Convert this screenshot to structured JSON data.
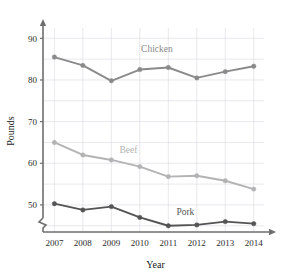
{
  "chart_data": {
    "type": "line",
    "title": "",
    "xlabel": "Year",
    "ylabel": "Pounds",
    "categories": [
      "2007",
      "2008",
      "2009",
      "2010",
      "2011",
      "2012",
      "2013",
      "2014"
    ],
    "x": [
      2007,
      2008,
      2009,
      2010,
      2011,
      2012,
      2013,
      2014
    ],
    "xlim": [
      2006.6,
      2014.5
    ],
    "ylim": [
      43.5,
      92
    ],
    "y_ticks": [
      50,
      60,
      70,
      80,
      90
    ],
    "y_tick_labels": [
      "50",
      "60",
      "70",
      "80",
      "90"
    ],
    "y_minor_gridlines": [
      45,
      50,
      55,
      60,
      65,
      70,
      75,
      80,
      85,
      90
    ],
    "grid": true,
    "axis_break": true,
    "legend": "inline-labels",
    "series": [
      {
        "name": "Chicken",
        "color": "#8a8a8a",
        "values": [
          85.5,
          83.5,
          79.8,
          82.5,
          83.0,
          80.5,
          82.0,
          83.3
        ],
        "label_x": 2010.6,
        "label_y": 86.6
      },
      {
        "name": "Beef",
        "color": "#b3b3b3",
        "values": [
          65.0,
          62.0,
          60.8,
          59.2,
          56.8,
          57.0,
          55.8,
          53.8
        ],
        "label_x": 2009.6,
        "label_y": 62.4
      },
      {
        "name": "Pork",
        "color": "#545454",
        "values": [
          50.3,
          48.8,
          49.6,
          47.0,
          45.0,
          45.2,
          46.0,
          45.5
        ],
        "label_x": 2011.6,
        "label_y": 47.6
      }
    ]
  },
  "axes": {
    "x_axis_title": "Year",
    "y_axis_title": "Pounds"
  },
  "colors": {
    "chicken": "#8a8a8a",
    "beef": "#b3b3b3",
    "pork": "#545454",
    "grid": "#d9d9e2",
    "axis": "#6e6e6e",
    "text": "#2b2b2b",
    "background": "#ffffff"
  }
}
